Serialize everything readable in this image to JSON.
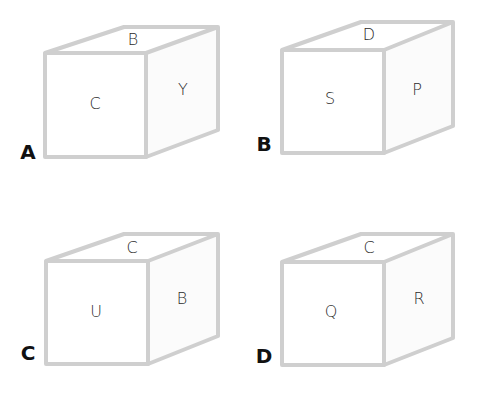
{
  "colors": {
    "edge": "#cfcfcf",
    "letter": "#2a2a2a",
    "option_label": "#111111",
    "background": "#ffffff"
  },
  "options": [
    {
      "label": "A",
      "faces": {
        "top": "B",
        "front": "C",
        "right": "Y"
      }
    },
    {
      "label": "B",
      "faces": {
        "top": "D",
        "front": "S",
        "right": "P"
      }
    },
    {
      "label": "C",
      "faces": {
        "top": "C",
        "front": "U",
        "right": "B"
      }
    },
    {
      "label": "D",
      "faces": {
        "top": "C",
        "front": "Q",
        "right": "R"
      }
    }
  ]
}
